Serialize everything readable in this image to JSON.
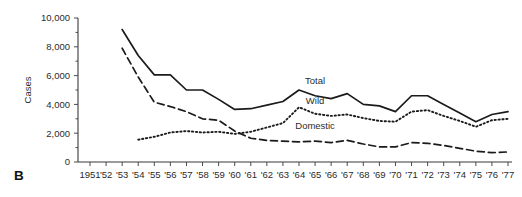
{
  "panel": {
    "label": "B"
  },
  "chart_data": {
    "type": "line",
    "title": "",
    "subtitle": "",
    "xlabel": "",
    "ylabel": "Cases",
    "ylim": [
      0,
      10000
    ],
    "xlim": [
      1951,
      1977
    ],
    "grid": false,
    "legend_position": "inline-annotations",
    "ytick_labels": [
      "0",
      "2,000",
      "4,000",
      "6,000",
      "8,000",
      "10,000"
    ],
    "ytick_values": [
      0,
      2000,
      4000,
      6000,
      8000,
      10000
    ],
    "x": [
      1951,
      1952,
      1953,
      1954,
      1955,
      1956,
      1957,
      1958,
      1959,
      1960,
      1961,
      1962,
      1963,
      1964,
      1965,
      1966,
      1967,
      1968,
      1969,
      1970,
      1971,
      1972,
      1973,
      1974,
      1975,
      1976,
      1977
    ],
    "xtick_labels": [
      "1951",
      "'52",
      "'53",
      "'54",
      "'55",
      "'56",
      "'57",
      "'58",
      "'59",
      "'60",
      "'61",
      "'62",
      "'63",
      "'64",
      "'65",
      "'66",
      "'67",
      "'68",
      "'69",
      "'70",
      "'71",
      "'72",
      "'73",
      "'74",
      "'75",
      "'76",
      "'77"
    ],
    "series": [
      {
        "name": "Total",
        "style": "solid",
        "color": "#1b1b1b",
        "start_year": 1953,
        "values": [
          null,
          null,
          9200,
          7400,
          6050,
          6050,
          5000,
          5000,
          4350,
          3650,
          3700,
          3950,
          4200,
          5000,
          4600,
          4400,
          4750,
          4000,
          3900,
          3500,
          4600,
          4600,
          4000,
          3400,
          2800,
          3300,
          3500
        ]
      },
      {
        "name": "Wild",
        "style": "dotted",
        "color": "#1b1b1b",
        "start_year": 1954,
        "values": [
          null,
          null,
          null,
          1550,
          1750,
          2050,
          2150,
          2050,
          2100,
          1950,
          2100,
          2400,
          2700,
          3800,
          3350,
          3200,
          3300,
          3050,
          2850,
          2800,
          3500,
          3600,
          3200,
          2850,
          2450,
          2900,
          3000
        ]
      },
      {
        "name": "Domestic",
        "style": "dashed",
        "color": "#1b1b1b",
        "start_year": 1953,
        "values": [
          null,
          null,
          7900,
          5900,
          4150,
          3850,
          3500,
          3000,
          2900,
          2150,
          1650,
          1500,
          1450,
          1400,
          1450,
          1350,
          1500,
          1250,
          1050,
          1050,
          1350,
          1300,
          1150,
          950,
          750,
          650,
          700
        ]
      }
    ],
    "annotations": [
      {
        "text": "Total",
        "x": 1965,
        "y": 5450
      },
      {
        "text": "Wild",
        "x": 1965,
        "y": 4050
      },
      {
        "text": "Domestic",
        "x": 1965,
        "y": 2300
      }
    ]
  }
}
